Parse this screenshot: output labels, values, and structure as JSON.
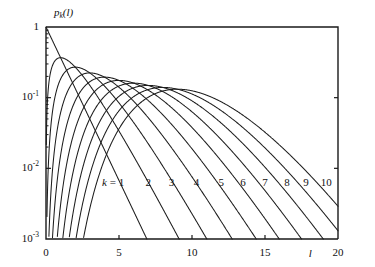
{
  "chart_data": {
    "type": "line",
    "title": "",
    "ylabel": "p_k(l)",
    "xlabel": "l",
    "xlim": [
      0,
      20
    ],
    "ylim": [
      0.001,
      1
    ],
    "yscale": "log",
    "xscale": "linear",
    "grid": false,
    "legend_position": "inline-curve-labels",
    "xticks": [
      {
        "value": 0,
        "label": "0"
      },
      {
        "value": 5,
        "label": "5"
      },
      {
        "value": 10,
        "label": "10"
      },
      {
        "value": 15,
        "label": "15"
      },
      {
        "value": 20,
        "label": "20"
      }
    ],
    "yticks": [
      {
        "value": 1,
        "mantissa": "1",
        "exponent": ""
      },
      {
        "value": 0.1,
        "mantissa": "10",
        "exponent": "-1"
      },
      {
        "value": 0.01,
        "mantissa": "10",
        "exponent": "-2"
      },
      {
        "value": 0.001,
        "mantissa": "10",
        "exponent": "-3"
      }
    ],
    "series": [
      {
        "name": "k = 1",
        "k": 1,
        "label": "k = 1",
        "label_x": 4.6,
        "label_y": 0.0062,
        "peak_l": 1,
        "peak_p": 0.368
      },
      {
        "name": "k = 2",
        "k": 2,
        "label": "2",
        "label_x": 7.0,
        "label_y": 0.0062,
        "peak_l": 2,
        "peak_p": 0.271
      },
      {
        "name": "k = 3",
        "k": 3,
        "label": "3",
        "label_x": 8.6,
        "label_y": 0.0062,
        "peak_l": 3,
        "peak_p": 0.224
      },
      {
        "name": "k = 4",
        "k": 4,
        "label": "4",
        "label_x": 10.3,
        "label_y": 0.0062,
        "peak_l": 4,
        "peak_p": 0.195
      },
      {
        "name": "k = 5",
        "k": 5,
        "label": "5",
        "label_x": 12.0,
        "label_y": 0.0062,
        "peak_l": 5,
        "peak_p": 0.175
      },
      {
        "name": "k = 6",
        "k": 6,
        "label": "6",
        "label_x": 13.5,
        "label_y": 0.0062,
        "peak_l": 6,
        "peak_p": 0.161
      },
      {
        "name": "k = 7",
        "k": 7,
        "label": "7",
        "label_x": 15.0,
        "label_y": 0.0062,
        "peak_l": 7,
        "peak_p": 0.149
      },
      {
        "name": "k = 8",
        "k": 8,
        "label": "8",
        "label_x": 16.5,
        "label_y": 0.0062,
        "peak_l": 8,
        "peak_p": 0.14
      },
      {
        "name": "k = 9",
        "k": 9,
        "label": "9",
        "label_x": 17.8,
        "label_y": 0.0062,
        "peak_l": 9,
        "peak_p": 0.132
      },
      {
        "name": "k = 10",
        "k": 10,
        "label": "10",
        "label_x": 19.2,
        "label_y": 0.0062,
        "peak_l": 10,
        "peak_p": 0.125
      }
    ]
  }
}
